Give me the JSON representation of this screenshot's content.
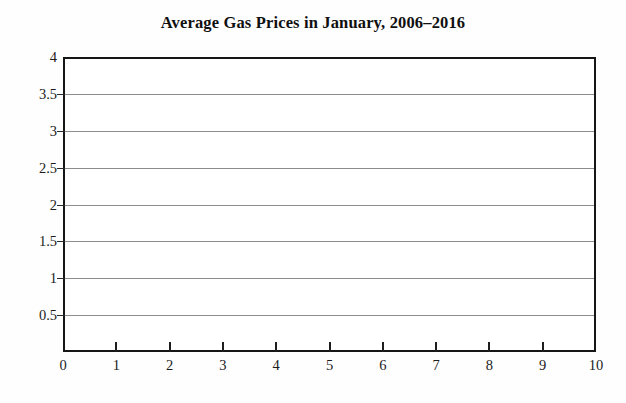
{
  "figure": {
    "background_color": "#fefefe",
    "plot_background_color": "#ffffff",
    "frame_color": "#161616",
    "gridline_color": "#8d8d8d",
    "text_color": "#1c1c1c"
  },
  "chart_data": {
    "type": "line",
    "title": "Average Gas Prices in January, 2006–2016",
    "subtitle": "",
    "xlabel": "",
    "ylabel": "",
    "xlim": [
      0,
      10
    ],
    "ylim": [
      0,
      4
    ],
    "x_ticks": [
      0,
      1,
      2,
      3,
      4,
      5,
      6,
      7,
      8,
      9,
      10
    ],
    "x_tick_labels": [
      "0",
      "1",
      "2",
      "3",
      "4",
      "5",
      "6",
      "7",
      "8",
      "9",
      "10"
    ],
    "y_ticks": [
      0,
      0.5,
      1,
      1.5,
      2,
      2.5,
      3,
      3.5,
      4
    ],
    "y_tick_labels": [
      "0",
      "0.5",
      "1",
      "1.5",
      "2",
      "2.5",
      "3",
      "3.5",
      "4"
    ],
    "grid": "horizontal",
    "grid_on": true,
    "legend": false,
    "legend_position": "none",
    "annotations": [],
    "series": [],
    "x": [],
    "values": [],
    "note": "Blank grid — axes and gridlines are drawn but no data series is plotted."
  },
  "y_axis": {
    "labels": [
      {
        "text": "4",
        "value": 4.0
      },
      {
        "text": "3.5",
        "value": 3.5
      },
      {
        "text": "3",
        "value": 3.0
      },
      {
        "text": "2.5",
        "value": 2.5
      },
      {
        "text": "2",
        "value": 2.0
      },
      {
        "text": "1.5",
        "value": 1.5
      },
      {
        "text": "1",
        "value": 1.0
      },
      {
        "text": "0.5",
        "value": 0.5
      }
    ],
    "origin_label": "0"
  },
  "x_axis": {
    "labels": [
      {
        "text": "0",
        "value": 0
      },
      {
        "text": "1",
        "value": 1
      },
      {
        "text": "2",
        "value": 2
      },
      {
        "text": "3",
        "value": 3
      },
      {
        "text": "4",
        "value": 4
      },
      {
        "text": "5",
        "value": 5
      },
      {
        "text": "6",
        "value": 6
      },
      {
        "text": "7",
        "value": 7
      },
      {
        "text": "8",
        "value": 8
      },
      {
        "text": "9",
        "value": 9
      },
      {
        "text": "10",
        "value": 10
      }
    ]
  }
}
